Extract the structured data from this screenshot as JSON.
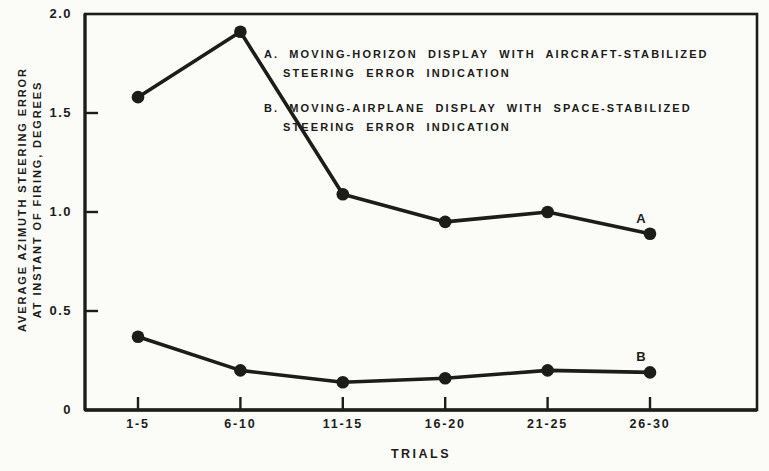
{
  "figure": {
    "background": "#fbfbf8",
    "ink": "#1c1c1a"
  },
  "chart_data": {
    "type": "line",
    "title": "",
    "xlabel": "TRIALS",
    "ylabel_lines": [
      "AVERAGE AZIMUTH STEERING ERROR",
      "AT INSTANT OF FIRING, DEGREES"
    ],
    "categories": [
      "1-5",
      "6-10",
      "11-15",
      "16-20",
      "21-25",
      "26-30"
    ],
    "y_ticks": [
      "2.0",
      "1.5",
      "1.0",
      "0.5",
      "0"
    ],
    "ylim": [
      0,
      2.0
    ],
    "grid": false,
    "marker": "filled-circle",
    "legend_position": "inside-top-right-text-block",
    "series": [
      {
        "name": "A",
        "end_label": "A",
        "values": [
          1.58,
          1.91,
          1.09,
          0.95,
          1.0,
          0.89
        ]
      },
      {
        "name": "B",
        "end_label": "B",
        "values": [
          0.37,
          0.2,
          0.14,
          0.16,
          0.2,
          0.19
        ]
      }
    ],
    "legend": [
      {
        "prefix": "A.",
        "line1": "MOVING-HORIZON DISPLAY WITH AIRCRAFT-STABILIZED",
        "line2": "STEERING ERROR INDICATION"
      },
      {
        "prefix": "B.",
        "line1": "MOVING-AIRPLANE DISPLAY WITH SPACE-STABILIZED",
        "line2": "STEERING ERROR INDICATION"
      }
    ]
  }
}
